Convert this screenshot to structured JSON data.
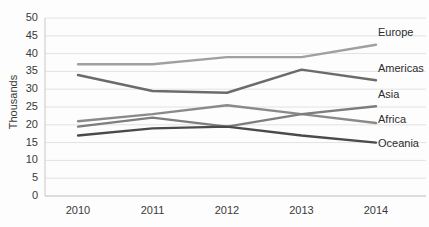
{
  "chart_data": {
    "type": "line",
    "title": "",
    "xlabel": "",
    "ylabel": "Thousands",
    "categories": [
      "2010",
      "2011",
      "2012",
      "2013",
      "2014"
    ],
    "ylim": [
      0,
      50
    ],
    "ytick_values": [
      0,
      5,
      10,
      15,
      20,
      25,
      30,
      35,
      40,
      45,
      50
    ],
    "ytick_labels": [
      "0",
      "5",
      "10",
      "15",
      "20",
      "25",
      "30",
      "35",
      "40",
      "45",
      "50"
    ],
    "grid": "horizontal",
    "legend_position": "right-inline",
    "series": [
      {
        "name": "Europe",
        "values": [
          37.0,
          37.0,
          39.0,
          39.0,
          42.5
        ],
        "color": "#a0a0a0"
      },
      {
        "name": "Americas",
        "values": [
          34.0,
          29.5,
          29.0,
          35.5,
          32.5
        ],
        "color": "#6b6b6b"
      },
      {
        "name": "Asia",
        "values": [
          21.0,
          23.0,
          25.5,
          23.0,
          20.5
        ],
        "color": "#8a8a8a"
      },
      {
        "name": "Africa",
        "values": [
          19.5,
          22.0,
          19.5,
          23.0,
          25.2
        ],
        "color": "#7d7d7d"
      },
      {
        "name": "Oceania",
        "values": [
          17.0,
          19.0,
          19.5,
          17.0,
          15.0
        ],
        "color": "#4a4a4a"
      }
    ]
  },
  "axis": {
    "y_title": "Thousands",
    "y_labels": [
      "50",
      "45",
      "40",
      "35",
      "30",
      "25",
      "20",
      "15",
      "10",
      "5",
      "0"
    ],
    "x_labels": [
      "2010",
      "2011",
      "2012",
      "2013",
      "2014"
    ]
  },
  "legend": {
    "items": [
      {
        "label": "Europe"
      },
      {
        "label": "Americas"
      },
      {
        "label": "Asia"
      },
      {
        "label": "Africa"
      },
      {
        "label": "Oceania"
      }
    ]
  },
  "colors": {
    "background": "#fdfdfd",
    "gridline": "#e2e2e2",
    "axis_line": "#c9c9c9",
    "tick_text": "#3a3a3a"
  }
}
